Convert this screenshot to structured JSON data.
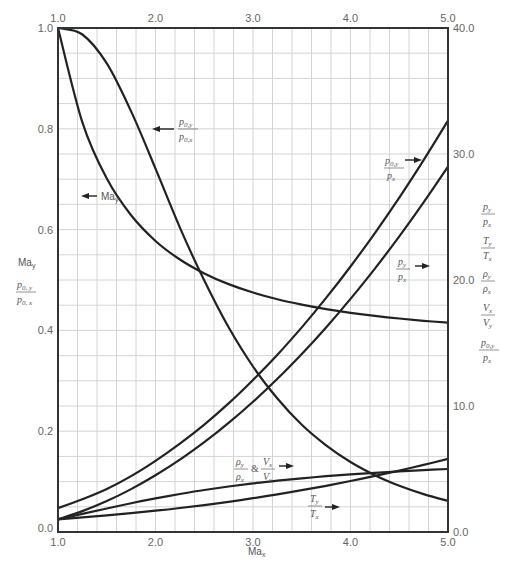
{
  "chart_data": {
    "type": "line",
    "title": "",
    "xlabel": "Ma_x",
    "ylabel_left": [
      "Ma_y",
      "p0,y / p0,x"
    ],
    "ylabel_right": [
      "p_y / p_x",
      "T_y / T_x",
      "ρ_y / ρ_x",
      "V_x / V_y",
      "p0,y / p_x"
    ],
    "xlim": [
      1.0,
      5.0
    ],
    "ylim_left": [
      0.0,
      1.0
    ],
    "ylim_right": [
      0.0,
      40.0
    ],
    "grid": true,
    "x_ticks_bottom": [
      "1.0",
      "2.0",
      "3.0",
      "4.0",
      "5.0"
    ],
    "x_ticks_top": [
      "1.0",
      "2.0",
      "3.0",
      "4.0",
      "5.0"
    ],
    "y_ticks_left": [
      "0.0",
      "0.2",
      "0.4",
      "0.6",
      "0.8",
      "1.0"
    ],
    "y_ticks_right": [
      "0.0",
      "10.0",
      "20.0",
      "30.0",
      "40.0"
    ],
    "x": [
      1.0,
      1.25,
      1.5,
      1.75,
      2.0,
      2.25,
      2.5,
      2.75,
      3.0,
      3.25,
      3.5,
      3.75,
      4.0,
      4.25,
      4.5,
      4.75,
      5.0
    ],
    "series": [
      {
        "name": "Ma_y",
        "axis": "left",
        "label_text": "Ma",
        "label_sub": "y",
        "values": [
          1.0,
          0.8126,
          0.7011,
          0.6284,
          0.5774,
          0.5406,
          0.513,
          0.4918,
          0.4752,
          0.4619,
          0.4512,
          0.4423,
          0.435,
          0.4289,
          0.4236,
          0.4191,
          0.4152
        ]
      },
      {
        "name": "p0,y/p0,x",
        "axis": "left",
        "values": [
          1.0,
          0.9871,
          0.9298,
          0.8346,
          0.7209,
          0.604,
          0.499,
          0.4062,
          0.3283,
          0.2649,
          0.2129,
          0.1721,
          0.1388,
          0.1127,
          0.0917,
          0.0751,
          0.0617
        ]
      },
      {
        "name": "p0,y/p_x",
        "axis": "right",
        "values": [
          1.893,
          2.596,
          3.413,
          4.434,
          5.64,
          7.009,
          8.526,
          10.206,
          12.061,
          14.065,
          16.242,
          18.578,
          21.068,
          23.725,
          26.539,
          29.515,
          32.654
        ]
      },
      {
        "name": "p_y/p_x",
        "axis": "right",
        "values": [
          1.0,
          1.656,
          2.458,
          3.406,
          4.5,
          5.74,
          7.125,
          8.656,
          10.333,
          12.156,
          14.125,
          16.24,
          18.5,
          20.906,
          23.458,
          26.156,
          29.0
        ]
      },
      {
        "name": "ρ_y/ρ_x & V_x/V_y",
        "axis": "right",
        "values": [
          1.0,
          1.433,
          1.862,
          2.285,
          2.667,
          3.019,
          3.333,
          3.612,
          3.857,
          4.071,
          4.261,
          4.426,
          4.571,
          4.698,
          4.812,
          4.912,
          5.0
        ]
      },
      {
        "name": "T_y/T_x",
        "axis": "right",
        "values": [
          1.0,
          1.156,
          1.32,
          1.491,
          1.688,
          1.902,
          2.138,
          2.396,
          2.679,
          2.985,
          3.315,
          3.67,
          4.047,
          4.449,
          4.875,
          5.327,
          5.8
        ]
      }
    ],
    "annotations": [
      {
        "text": "p0,y / p0,x",
        "arrow": "left"
      },
      {
        "text": "Ma_y",
        "arrow": "left"
      },
      {
        "text": "p0,y / p_x",
        "arrow": "right"
      },
      {
        "text": "p_y / p_x",
        "arrow": "right"
      },
      {
        "text": "ρ_y/ρ_x & V_x/V_y",
        "arrow": "right"
      },
      {
        "text": "T_y / T_x",
        "arrow": "right"
      }
    ]
  },
  "labels": {
    "xaxis": "Ma",
    "xaxis_sub": "x",
    "left_ma": "Ma",
    "left_ma_sub": "y",
    "p0": "p",
    "sub_0y": "0, y",
    "sub_0x": "0, x",
    "sub_0y_short": "0,y",
    "sub_0x_short": "0,x",
    "p": "p",
    "T": "T",
    "rho": "ρ",
    "V": "V",
    "sub_x": "x",
    "sub_y": "y",
    "amp": "&"
  }
}
